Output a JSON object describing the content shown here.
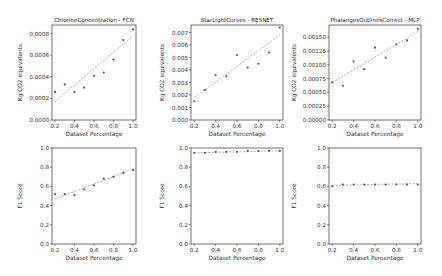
{
  "chart_data": [
    {
      "type": "scatter",
      "title": "ChlorineConcentration - FCN",
      "xlabel": "Dataset Percentage",
      "ylabel": "Kg CO2 equivalents",
      "x": [
        0.2,
        0.3,
        0.4,
        0.5,
        0.6,
        0.7,
        0.8,
        0.9,
        1.0
      ],
      "values": [
        0.00026,
        0.00033,
        0.00026,
        0.0003,
        0.00041,
        0.00044,
        0.00056,
        0.00074,
        0.00084
      ],
      "trend": [
        0.00017,
        0.00078
      ],
      "xlim": [
        0.17,
        1.03
      ],
      "ylim": [
        0.0,
        0.00088
      ],
      "xticks": [
        "0.2",
        "0.4",
        "0.6",
        "0.8",
        "1.0"
      ],
      "yticks": [
        "0.0000",
        "0.0002",
        "0.0004",
        "0.0006",
        "0.0008"
      ],
      "ytick_values": [
        0,
        0.0002,
        0.0004,
        0.0006,
        0.0008
      ],
      "grid": false
    },
    {
      "type": "scatter",
      "title": "StarLightCurves - RESNET",
      "xlabel": "Dataset Percentage",
      "ylabel": "Kg CO2 equivalents",
      "x": [
        0.2,
        0.3,
        0.4,
        0.5,
        0.6,
        0.7,
        0.8,
        0.9,
        1.0
      ],
      "values": [
        0.0015,
        0.0024,
        0.0036,
        0.0035,
        0.0052,
        0.0042,
        0.0045,
        0.0054,
        0.0074
      ],
      "trend": [
        0.0018,
        0.0068
      ],
      "xlim": [
        0.17,
        1.03
      ],
      "ylim": [
        0.0,
        0.0076
      ],
      "xticks": [
        "0.2",
        "0.4",
        "0.6",
        "0.8",
        "1.0"
      ],
      "yticks": [
        "0.000",
        "0.001",
        "0.002",
        "0.003",
        "0.004",
        "0.005",
        "0.006",
        "0.007"
      ],
      "ytick_values": [
        0,
        0.001,
        0.002,
        0.003,
        0.004,
        0.005,
        0.006,
        0.007
      ],
      "grid": false
    },
    {
      "type": "scatter",
      "title": "PhalangesOutlinesCorrect - MLP",
      "xlabel": "Dataset Percentage",
      "ylabel": "Kg CO2 equivalents",
      "x": [
        0.2,
        0.3,
        0.4,
        0.5,
        0.6,
        0.7,
        0.8,
        0.9,
        1.0
      ],
      "values": [
        0.00068,
        0.00062,
        0.00106,
        0.00092,
        0.00131,
        0.00113,
        0.00137,
        0.00144,
        0.00165
      ],
      "trend": [
        0.00068,
        0.0016
      ],
      "xlim": [
        0.17,
        1.03
      ],
      "ylim": [
        0.0,
        0.00172
      ],
      "xticks": [
        "0.2",
        "0.4",
        "0.6",
        "0.8",
        "1.0"
      ],
      "yticks": [
        "0.00000",
        "0.00025",
        "0.00050",
        "0.00075",
        "0.00100",
        "0.00125",
        "0.00150"
      ],
      "ytick_values": [
        0,
        0.00025,
        0.0005,
        0.00075,
        0.001,
        0.00125,
        0.0015
      ],
      "grid": false
    },
    {
      "type": "line",
      "title": "",
      "xlabel": "Dataset Percentage",
      "ylabel": "F1 Score",
      "x": [
        0.2,
        0.3,
        0.4,
        0.5,
        0.6,
        0.7,
        0.8,
        0.9,
        1.0
      ],
      "values": [
        0.52,
        0.52,
        0.51,
        0.57,
        0.61,
        0.68,
        0.7,
        0.74,
        0.77
      ],
      "trend": [
        0.47,
        0.78
      ],
      "xlim": [
        0.17,
        1.03
      ],
      "ylim": [
        0.0,
        1.0
      ],
      "xticks": [
        "0.2",
        "0.4",
        "0.6",
        "0.8",
        "1.0"
      ],
      "yticks": [
        "0.0",
        "0.2",
        "0.4",
        "0.6",
        "0.8",
        "1.0"
      ],
      "ytick_values": [
        0,
        0.2,
        0.4,
        0.6,
        0.8,
        1.0
      ],
      "grid": false
    },
    {
      "type": "line",
      "title": "",
      "xlabel": "Dataset Percentage",
      "ylabel": "F1 Score",
      "x": [
        0.2,
        0.3,
        0.4,
        0.5,
        0.6,
        0.7,
        0.8,
        0.9,
        1.0
      ],
      "values": [
        0.95,
        0.95,
        0.96,
        0.96,
        0.96,
        0.97,
        0.97,
        0.97,
        0.97
      ],
      "trend": [
        0.95,
        0.97
      ],
      "xlim": [
        0.17,
        1.03
      ],
      "ylim": [
        0.0,
        1.0
      ],
      "xticks": [
        "0.2",
        "0.4",
        "0.6",
        "0.8",
        "1.0"
      ],
      "yticks": [
        "0.0",
        "0.2",
        "0.4",
        "0.6",
        "0.8",
        "1.0"
      ],
      "ytick_values": [
        0,
        0.2,
        0.4,
        0.6,
        0.8,
        1.0
      ],
      "grid": false
    },
    {
      "type": "line",
      "title": "",
      "xlabel": "Dataset Percentage",
      "ylabel": "F1 Score",
      "x": [
        0.2,
        0.3,
        0.4,
        0.5,
        0.6,
        0.7,
        0.8,
        0.9,
        1.0
      ],
      "values": [
        0.6,
        0.62,
        0.62,
        0.62,
        0.62,
        0.62,
        0.62,
        0.62,
        0.62
      ],
      "trend": [
        0.61,
        0.63
      ],
      "xlim": [
        0.17,
        1.03
      ],
      "ylim": [
        0.0,
        1.0
      ],
      "xticks": [
        "0.2",
        "0.4",
        "0.6",
        "0.8",
        "1.0"
      ],
      "yticks": [
        "0.0",
        "0.2",
        "0.4",
        "0.6",
        "0.8",
        "1.0"
      ],
      "ytick_values": [
        0,
        0.2,
        0.4,
        0.6,
        0.8,
        1.0
      ],
      "grid": false
    }
  ],
  "layout": {
    "panels": [
      {
        "x0": 52,
        "y0": 25,
        "x1": 136,
        "y1": 120
      },
      {
        "x0": 191,
        "y0": 25,
        "x1": 283,
        "y1": 120
      },
      {
        "x0": 329,
        "y0": 25,
        "x1": 421,
        "y1": 120
      },
      {
        "x0": 52,
        "y0": 148,
        "x1": 136,
        "y1": 244
      },
      {
        "x0": 191,
        "y0": 148,
        "x1": 283,
        "y1": 244
      },
      {
        "x0": 329,
        "y0": 148,
        "x1": 421,
        "y1": 244
      }
    ],
    "marker_color": "#555555",
    "trend_color": "#888888"
  }
}
